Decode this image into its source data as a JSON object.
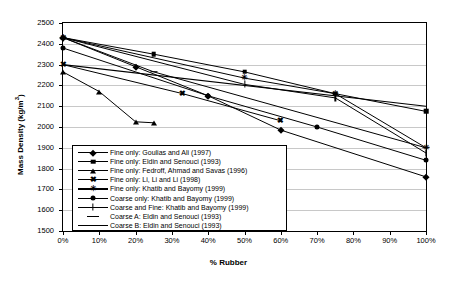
{
  "chart_data": {
    "type": "line",
    "title": "",
    "xlabel": "% Rubber",
    "ylabel": "Mass Density (kg/m3)",
    "ylabel_display": "Mass Density (kg/m",
    "ylabel_sup": "3",
    "ylabel_tail": ")",
    "xlim": [
      0,
      100
    ],
    "ylim": [
      1500,
      2500
    ],
    "ytick_step": 100,
    "xtick_step": 10,
    "grid": "horizontal",
    "legend_position": "inside-lower-left",
    "xticks": [
      "0%",
      "10%",
      "20%",
      "30%",
      "40%",
      "50%",
      "60%",
      "70%",
      "80%",
      "90%",
      "100%"
    ],
    "xtick_values": [
      0,
      10,
      20,
      30,
      40,
      50,
      60,
      70,
      80,
      90,
      100
    ],
    "yticks": [
      "1500",
      "1600",
      "1700",
      "1800",
      "1900",
      "2000",
      "2100",
      "2200",
      "2300",
      "2400",
      "2500"
    ],
    "ytick_values": [
      1500,
      1600,
      1700,
      1800,
      1900,
      2000,
      2100,
      2200,
      2300,
      2400,
      2500
    ],
    "series": [
      {
        "name": "Fine only: Goulias and Ali (1997)",
        "marker": "diamond",
        "line": "solid",
        "x": [
          0,
          20,
          40,
          60,
          100
        ],
        "values": [
          2430,
          2290,
          2150,
          1985,
          1760
        ]
      },
      {
        "name": "Fine only: Eldin and Senouci (1993)",
        "marker": "square",
        "line": "solid",
        "x": [
          0,
          25,
          50,
          75,
          100
        ],
        "values": [
          2430,
          2350,
          2265,
          2160,
          2075
        ]
      },
      {
        "name": "Fine only: Fedroff, Ahmad and Savas (1996)",
        "marker": "triangle",
        "line": "solid",
        "x": [
          0,
          10,
          20,
          25
        ],
        "values": [
          2265,
          2170,
          2025,
          2020
        ]
      },
      {
        "name": "Fine only: Li, Li and Li (1998)",
        "marker": "bowtie",
        "line": "solid",
        "x": [
          0,
          33,
          60
        ],
        "values": [
          2300,
          2160,
          2030
        ]
      },
      {
        "name": "Fine only: Khatib and Bayomy (1999)",
        "marker": "star",
        "line": "solid",
        "x": [
          0,
          50,
          75,
          100
        ],
        "values": [
          2430,
          2235,
          2160,
          1900
        ]
      },
      {
        "name": "Coarse only: Khatib and Bayomy (1999)",
        "marker": "circle",
        "line": "solid",
        "x": [
          0,
          40,
          70,
          100
        ],
        "values": [
          2380,
          2150,
          2000,
          1840
        ]
      },
      {
        "name": "Coarse and Fine: Khatib and Bayomy (1999)",
        "marker": "plus",
        "line": "solid",
        "x": [
          0,
          50,
          75,
          100
        ],
        "values": [
          2430,
          2205,
          2140,
          1875
        ]
      },
      {
        "name": "Coarse A: Eldin and Senouci (1993)",
        "marker": "dash",
        "line": "solid",
        "x": [
          0,
          25,
          100
        ],
        "values": [
          2430,
          2265,
          1900
        ]
      },
      {
        "name": "Coarse B: Eldin and Senouci (1993)",
        "marker": "none",
        "line": "solid",
        "x": [
          0,
          100
        ],
        "values": [
          2300,
          2100
        ]
      }
    ]
  }
}
